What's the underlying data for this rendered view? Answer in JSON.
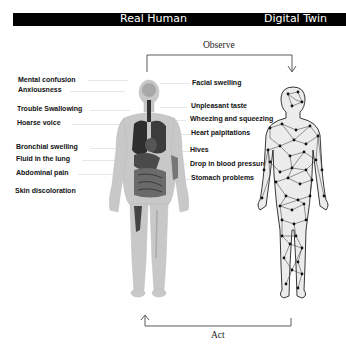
{
  "header": {
    "left_title": "Real Human",
    "right_title": "Digital Twin",
    "bar_color": "#000000"
  },
  "flow": {
    "top_label": "Observe",
    "bottom_label": "Act"
  },
  "symptoms": {
    "left": [
      {
        "label": "Mental confusion",
        "y": 76
      },
      {
        "label": "Anxiousness",
        "y": 87
      },
      {
        "label": "Trouble Swallowing",
        "y": 106
      },
      {
        "label": "Hoarse voice",
        "y": 120
      },
      {
        "label": "Bronchial swelling",
        "y": 144
      },
      {
        "label": "Fluid in the lung",
        "y": 156
      },
      {
        "label": "Abdominal pain",
        "y": 170
      },
      {
        "label": "Skin discoloration",
        "y": 188
      }
    ],
    "right": [
      {
        "label": "Facial swelling",
        "y": 79
      },
      {
        "label": "Unpleasant taste",
        "y": 103
      },
      {
        "label": "Wheezing and squeezing",
        "y": 116
      },
      {
        "label": "Heart palpitations",
        "y": 130
      },
      {
        "label": "Hives",
        "y": 147
      },
      {
        "label": "Drop in blood pressure",
        "y": 160
      },
      {
        "label": "Stomach problems",
        "y": 175
      }
    ]
  },
  "figures": {
    "left": "anatomical-human",
    "right": "network-mesh-human"
  }
}
